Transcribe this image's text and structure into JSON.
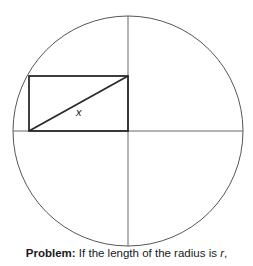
{
  "diagram": {
    "circle": {
      "cx": 128,
      "cy": 131,
      "r": 115,
      "stroke": "#555555"
    },
    "diameters": {
      "horizontal": {
        "x1": 13,
        "y1": 131,
        "x2": 243,
        "y2": 131
      },
      "vertical": {
        "x1": 128,
        "y1": 16,
        "x2": 128,
        "y2": 246
      }
    },
    "rectangle": {
      "x": 29,
      "y": 76,
      "width": 99,
      "height": 55,
      "stroke": "#2a2a2a"
    },
    "diagonal": {
      "x1": 29,
      "y1": 131,
      "x2": 128,
      "y2": 76,
      "label": "x",
      "label_x": 76,
      "label_y": 116
    }
  },
  "caption": {
    "bold_part": "Problem:",
    "text_part": " If the length of the radius is ",
    "variable": "r",
    "trailing": ","
  }
}
